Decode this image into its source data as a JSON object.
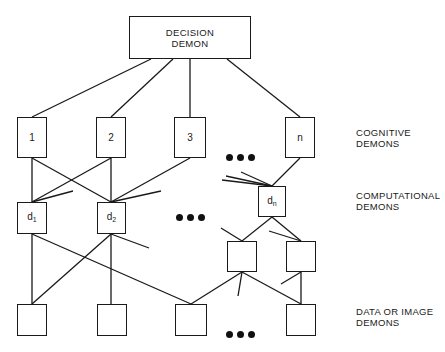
{
  "decision": {
    "line1": "DECISION",
    "line2": "DEMON"
  },
  "cognitive": {
    "boxes": [
      "1",
      "2",
      "3",
      "n"
    ],
    "label_line1": "COGNITIVE",
    "label_line2": "DEMONS"
  },
  "computational": {
    "boxes": [
      {
        "base": "d",
        "sub": "1"
      },
      {
        "base": "d",
        "sub": "2"
      },
      {
        "base": "d",
        "sub": "n"
      }
    ],
    "label_line1": "COMPUTATIONAL",
    "label_line2": "DEMONS"
  },
  "data": {
    "label_line1": "DATA OR IMAGE",
    "label_line2": "DEMONS",
    "box_count": 4
  },
  "ellipsis": "•••"
}
